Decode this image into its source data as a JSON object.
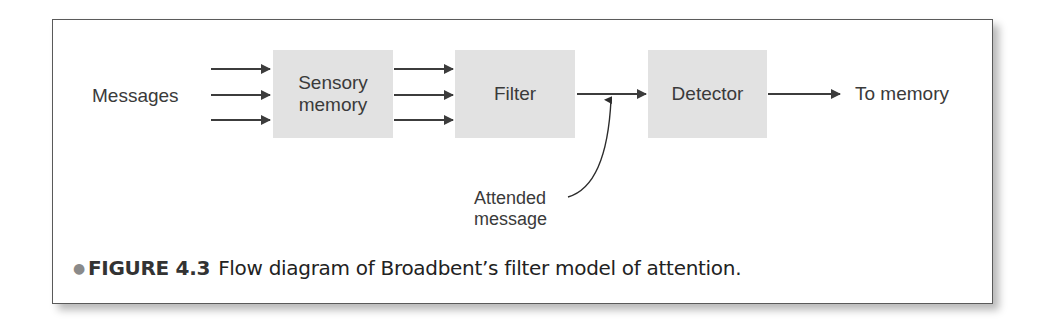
{
  "figure": {
    "input_label": "Messages",
    "boxes": [
      {
        "id": "sensory-memory",
        "label_line1": "Sensory",
        "label_line2": "memory"
      },
      {
        "id": "filter",
        "label": "Filter"
      },
      {
        "id": "detector",
        "label": "Detector"
      }
    ],
    "output_label": "To memory",
    "attended_label_line1": "Attended",
    "attended_label_line2": "message",
    "caption": {
      "figure_number": "FIGURE 4.3",
      "text": "Flow diagram of Broadbent’s filter model of attention."
    }
  },
  "colors": {
    "box_fill": "#e2e2e2",
    "arrow": "#3c3c3c",
    "border": "#5a5a5a"
  }
}
